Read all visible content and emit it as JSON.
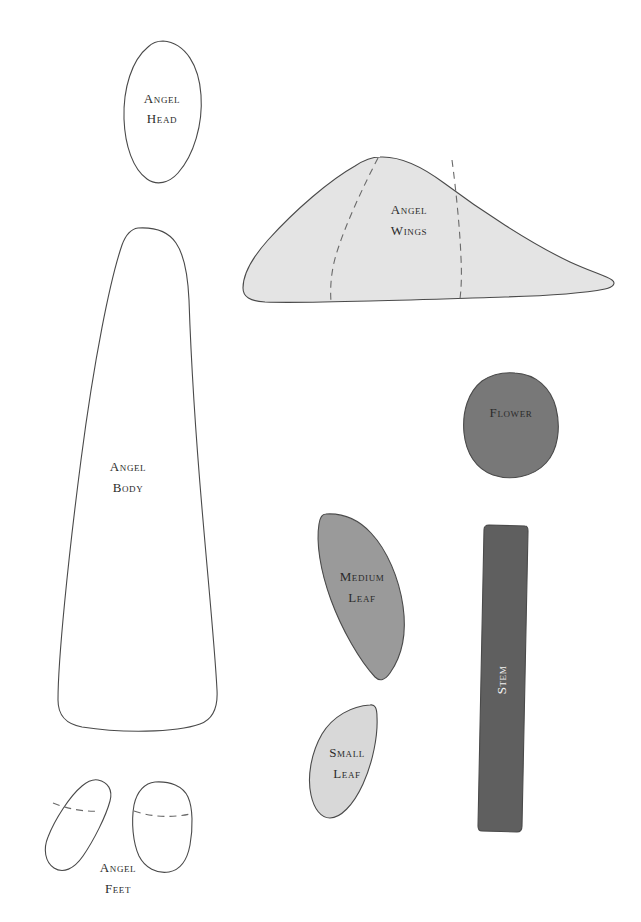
{
  "document": {
    "kind": "craft-pattern-template",
    "background_color": "#ffffff",
    "width": 641,
    "height": 922
  },
  "palette": {
    "outline_stroke": "#4a4a4a",
    "fold_line_stroke": "#6a6a6a",
    "label_dark": "#2b2b2b",
    "label_light": "#f2f2f2",
    "paper_white": "#ffffff",
    "wings_fill": "#e4e4e4",
    "flower_fill": "#787878",
    "medium_leaf_fill": "#9a9a9a",
    "small_leaf_fill": "#d8d8d8",
    "stem_fill": "#5f5f5f"
  },
  "pieces": [
    {
      "id": "angel-head",
      "label_line1": "Angel",
      "label_line2": "Head",
      "fill": "#ffffff",
      "outlined": true,
      "has_fold_lines": false,
      "label_color": "dark"
    },
    {
      "id": "angel-body",
      "label_line1": "Angel",
      "label_line2": "Body",
      "fill": "#ffffff",
      "outlined": true,
      "has_fold_lines": false,
      "label_color": "dark"
    },
    {
      "id": "angel-wings",
      "label_line1": "Angel",
      "label_line2": "Wings",
      "fill": "#e4e4e4",
      "outlined": true,
      "has_fold_lines": true,
      "fold_line_count": 2,
      "label_color": "dark"
    },
    {
      "id": "flower",
      "label_line1": "Flower",
      "label_line2": "",
      "fill": "#787878",
      "outlined": true,
      "has_fold_lines": false,
      "label_color": "dark"
    },
    {
      "id": "medium-leaf",
      "label_line1": "Medium",
      "label_line2": "Leaf",
      "fill": "#9a9a9a",
      "outlined": true,
      "has_fold_lines": false,
      "label_color": "dark"
    },
    {
      "id": "small-leaf",
      "label_line1": "Small",
      "label_line2": "Leaf",
      "fill": "#d8d8d8",
      "outlined": true,
      "has_fold_lines": false,
      "label_color": "dark"
    },
    {
      "id": "stem",
      "label_line1": "Stem",
      "label_line2": "",
      "fill": "#5f5f5f",
      "outlined": true,
      "has_fold_lines": false,
      "label_color": "light",
      "label_rotated": true,
      "label_rotation_degrees": -90
    },
    {
      "id": "angel-feet",
      "label_line1": "Angel",
      "label_line2": "Feet",
      "fill": "#ffffff",
      "outlined": true,
      "has_fold_lines": true,
      "fold_line_count": 2,
      "piece_count": 2,
      "label_color": "dark"
    }
  ]
}
